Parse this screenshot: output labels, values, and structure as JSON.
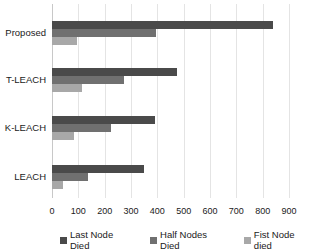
{
  "chart_data": {
    "type": "bar",
    "orientation": "horizontal",
    "title": "",
    "xlabel": "",
    "ylabel": "",
    "categories": [
      "Proposed",
      "T-LEACH",
      "K-LEACH",
      "LEACH"
    ],
    "series": [
      {
        "name": "Last Node Died",
        "color": "#4a4a4a",
        "values": [
          840,
          475,
          390,
          350
        ]
      },
      {
        "name": "Half Nodes Died",
        "color": "#707070",
        "values": [
          395,
          275,
          225,
          138
        ]
      },
      {
        "name": "Fist Node died",
        "color": "#a8a8a8",
        "values": [
          95,
          115,
          85,
          42
        ]
      }
    ],
    "xlim": [
      0,
      900
    ],
    "xticks": [
      0,
      100,
      200,
      300,
      400,
      500,
      600,
      700,
      800,
      900
    ],
    "grid": true,
    "legend_position": "bottom"
  }
}
